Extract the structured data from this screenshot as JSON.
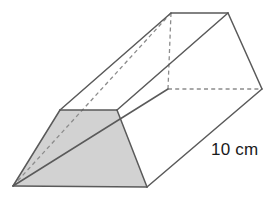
{
  "figure": {
    "name": "trapezoidal-prism",
    "projection": "oblique",
    "background_color": "#ffffff",
    "edge_color": "#5a5a5a",
    "hidden_edge_color": "#8c8c8c",
    "shaded_face_fill": "#d2d2d2",
    "shaded_face_stroke": "#5a5a5a",
    "label_color": "#1a1a1a"
  },
  "labels": {
    "length": "10 cm"
  },
  "geometry": {
    "front_face": {
      "name": "front-trapezoid-face",
      "shaded": true,
      "points": "13,186 147,187 117,110 60,110"
    },
    "back_face": {
      "name": "back-trapezoid-face",
      "points": "168,89 262,89 228,13 171,13"
    },
    "top_face": {
      "name": "top-rectangular-face",
      "points": "60,110 117,110 228,13 171,13"
    },
    "right_face": {
      "name": "right-slant-face",
      "points": "147,187 117,110 228,13 262,89"
    },
    "visible_edges": [
      {
        "name": "front-bottom-edge",
        "x1": 13,
        "y1": 186,
        "x2": 147,
        "y2": 187
      },
      {
        "name": "front-left-slant-edge",
        "x1": 13,
        "y1": 186,
        "x2": 60,
        "y2": 110
      },
      {
        "name": "front-top-edge",
        "x1": 60,
        "y1": 110,
        "x2": 117,
        "y2": 110
      },
      {
        "name": "front-right-slant-edge",
        "x1": 117,
        "y1": 110,
        "x2": 147,
        "y2": 187
      },
      {
        "name": "top-left-lateral-edge",
        "x1": 60,
        "y1": 110,
        "x2": 171,
        "y2": 13
      },
      {
        "name": "top-right-lateral-edge",
        "x1": 117,
        "y1": 110,
        "x2": 228,
        "y2": 13
      },
      {
        "name": "bottom-right-lateral-edge",
        "x1": 147,
        "y1": 187,
        "x2": 262,
        "y2": 89
      },
      {
        "name": "back-top-edge",
        "x1": 171,
        "y1": 13,
        "x2": 228,
        "y2": 13
      },
      {
        "name": "back-right-slant-edge",
        "x1": 228,
        "y1": 13,
        "x2": 262,
        "y2": 89
      },
      {
        "name": "left-upper-slant-edge",
        "x1": 13,
        "y1": 186,
        "x2": 168,
        "y2": 89
      }
    ],
    "hidden_edges": [
      {
        "name": "back-bottom-hidden-edge",
        "x1": 168,
        "y1": 89,
        "x2": 262,
        "y2": 89
      },
      {
        "name": "back-left-slant-hidden-edge",
        "x1": 168,
        "y1": 89,
        "x2": 171,
        "y2": 13
      },
      {
        "name": "diagonal-hidden-edge",
        "x1": 13,
        "y1": 186,
        "x2": 171,
        "y2": 13
      }
    ]
  }
}
